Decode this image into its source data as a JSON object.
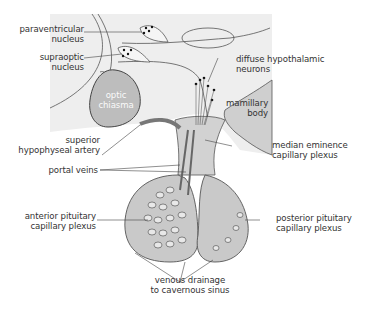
{
  "diagram": {
    "colors": {
      "background": "#ffffff",
      "brain_region": "#eeeeee",
      "tissue_gray": "#c8c8c8",
      "vessel_gray": "#9a9a9a",
      "outline": "#3a3a3a",
      "text": "#333333",
      "neuron_dot": "#111111"
    },
    "labels": {
      "paraventricular": [
        "paraventricular",
        "nucleus"
      ],
      "supraoptic": [
        "supraoptic",
        "nucleus"
      ],
      "optic_chiasma": [
        "optic",
        "chiasma"
      ],
      "diffuse_neurons": [
        "diffuse hypothalamic",
        "neurons"
      ],
      "mamillary_body": [
        "mamillary",
        "body"
      ],
      "superior_artery": [
        "superior",
        "hypophyseal artery"
      ],
      "median_eminence": [
        "median eminence",
        "capillary plexus"
      ],
      "portal_veins": [
        "portal veins"
      ],
      "anterior_plexus": [
        "anterior pituitary",
        "capillary plexus"
      ],
      "posterior_plexus": [
        "posterior pituitary",
        "capillary plexus"
      ],
      "venous_drainage": [
        "venous drainage",
        "to cavernous sinus"
      ]
    }
  }
}
